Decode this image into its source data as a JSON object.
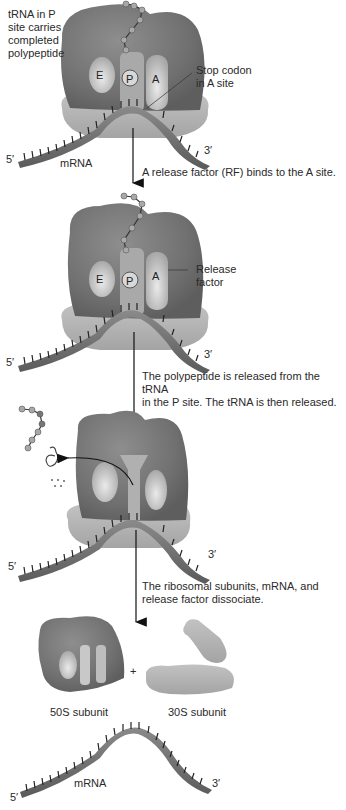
{
  "colors": {
    "large_subunit": "#7a7a7a",
    "small_subunit": "#b4b4b4",
    "site_pocket": "#cfcfcf",
    "mrna_strand": "#6e6e6e",
    "amino_acid": "#a8a8a8",
    "arrow": "#111111"
  },
  "panel1": {
    "note": "tRNA in P\nsite carries\ncompleted\npolypeptide",
    "site_e": "E",
    "site_p": "P",
    "site_a": "A",
    "stop_codon_label": "Stop codon\nin A site",
    "five_prime": "5′",
    "three_prime": "3′",
    "mrna_label": "mRNA"
  },
  "step1_caption": "A release factor (RF) binds to the A site.",
  "panel2": {
    "site_e": "E",
    "site_p": "P",
    "site_a": "A",
    "release_factor_label": "Release\nfactor",
    "five_prime": "5′",
    "three_prime": "3′"
  },
  "step2_caption": "The polypeptide is released from the tRNA\nin the P site. The tRNA is then released.",
  "panel3": {
    "five_prime": "5′",
    "three_prime": "3′"
  },
  "step3_caption": "The ribosomal subunits, mRNA, and\nrelease factor dissociate.",
  "panel4": {
    "plus": "+",
    "large_subunit_label": "50S subunit",
    "small_subunit_label": "30S subunit",
    "mrna_label": "mRNA",
    "five_prime": "5′",
    "three_prime": "3′"
  }
}
